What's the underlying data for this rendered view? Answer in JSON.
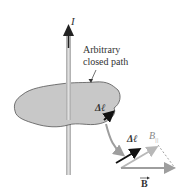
{
  "figure": {
    "current_label": "I",
    "path_label_line1": "Arbitrary",
    "path_label_line2": "closed path",
    "dl_label_on_path": "Δℓ",
    "dl_label_detail": "Δℓ",
    "b_parallel_label": "B",
    "b_parallel_subscript": "||",
    "b_vector_label": "B"
  },
  "colors": {
    "background": "#ffffff",
    "surface_fill": "#c8c8c8",
    "surface_outline": "#555555",
    "wire": "#bdbdbd",
    "dl_arrow": "#111111",
    "b_arrow": "#9e9e9e",
    "b_parallel_arrow": "#b8b8b8",
    "text": "#333333"
  }
}
